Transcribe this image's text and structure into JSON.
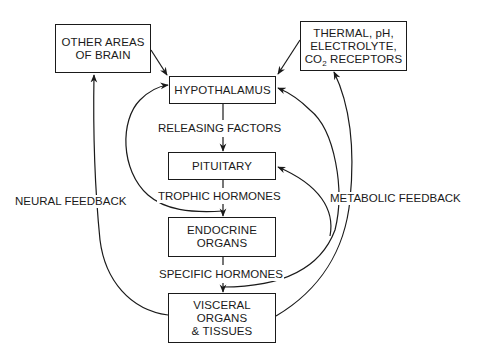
{
  "diagram": {
    "type": "flowchart",
    "title": "",
    "nodes": {
      "other_brain": {
        "lines": [
          "OTHER AREAS",
          "OF BRAIN"
        ]
      },
      "receptors": {
        "lines": [
          "THERMAL, pH,",
          "ELECTROLYTE,"
        ],
        "line3_prefix": "CO",
        "line3_sub": "2",
        "line3_suffix": " RECEPTORS"
      },
      "hypothalamus": {
        "lines": [
          "HYPOTHALAMUS"
        ]
      },
      "pituitary": {
        "lines": [
          "PITUITARY"
        ]
      },
      "endocrine": {
        "lines": [
          "ENDOCRINE",
          "ORGANS"
        ]
      },
      "visceral": {
        "lines": [
          "VISCERAL",
          "ORGANS",
          "& TISSUES"
        ]
      }
    },
    "edge_labels": {
      "releasing_factors": "RELEASING FACTORS",
      "trophic_hormones": "TROPHIC HORMONES",
      "specific_hormones": "SPECIFIC HORMONES",
      "neural_feedback": "NEURAL FEEDBACK",
      "metabolic_feedback": "METABOLIC FEEDBACK"
    },
    "edges": [
      {
        "from": "other_brain",
        "to": "hypothalamus",
        "label": ""
      },
      {
        "from": "receptors",
        "to": "hypothalamus",
        "label": ""
      },
      {
        "from": "hypothalamus",
        "to": "pituitary",
        "label": "RELEASING FACTORS"
      },
      {
        "from": "pituitary",
        "to": "endocrine",
        "label": "TROPHIC HORMONES"
      },
      {
        "from": "endocrine",
        "to": "visceral",
        "label": "SPECIFIC HORMONES"
      },
      {
        "from": "visceral",
        "to": "other_brain",
        "label": "NEURAL FEEDBACK"
      },
      {
        "from": "visceral",
        "to": "receptors",
        "label": "METABOLIC FEEDBACK"
      },
      {
        "from": "endocrine",
        "to": "hypothalamus",
        "label": ""
      },
      {
        "from": "visceral",
        "to": "hypothalamus",
        "label": "METABOLIC FEEDBACK"
      },
      {
        "from": "visceral",
        "to": "pituitary",
        "label": "METABOLIC FEEDBACK"
      }
    ],
    "colors": {
      "stroke": "#1a1a1a",
      "background": "#ffffff"
    }
  }
}
